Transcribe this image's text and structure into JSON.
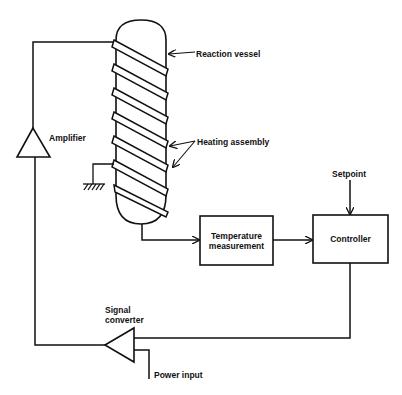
{
  "diagram": {
    "type": "process-control-block-diagram",
    "labels": {
      "reaction_vessel": "Reaction vessel",
      "heating_assembly": "Heating assembly",
      "amplifier": "Amplifier",
      "setpoint": "Setpoint",
      "temperature_measurement_line1": "Temperature",
      "temperature_measurement_line2": "measurement",
      "controller": "Controller",
      "signal_converter_line1": "Signal",
      "signal_converter_line2": "converter",
      "power_input": "Power input"
    },
    "colors": {
      "line": "#111111",
      "background": "#ffffff"
    },
    "connections": [
      {
        "from": "Reaction vessel",
        "to": "Temperature measurement"
      },
      {
        "from": "Temperature measurement",
        "to": "Controller"
      },
      {
        "from": "Setpoint",
        "to": "Controller"
      },
      {
        "from": "Controller",
        "to": "Signal converter"
      },
      {
        "from": "Power input",
        "to": "Signal converter"
      },
      {
        "from": "Signal converter",
        "to": "Amplifier"
      },
      {
        "from": "Amplifier",
        "to": "Heating assembly"
      }
    ]
  }
}
